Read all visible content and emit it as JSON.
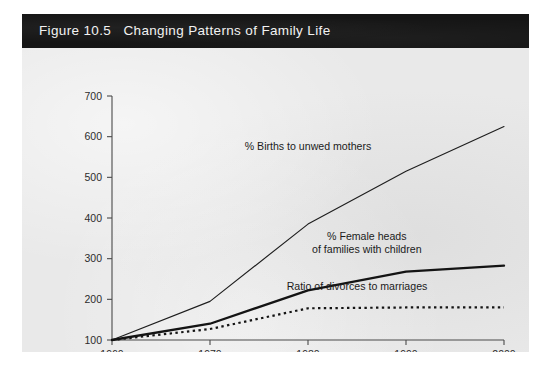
{
  "figure": {
    "title": "Figure 10.5   Changing Patterns of Family Life",
    "background_color": "#e9e9e9",
    "header_color": "#151515",
    "header_text_color": "#f2f2f2"
  },
  "chart_data": {
    "type": "line",
    "title": "Figure 10.5   Changing Patterns of Family Life",
    "xlabel": "",
    "ylabel": "",
    "x": [
      1960,
      1970,
      1980,
      1990,
      2000
    ],
    "xlim": [
      1960,
      2000
    ],
    "ylim": [
      100,
      700
    ],
    "xticks": [
      1960,
      1970,
      1980,
      1990,
      2000
    ],
    "yticks": [
      100,
      200,
      300,
      400,
      500,
      600,
      700
    ],
    "xtick_labels": [
      "1960",
      "1970",
      "1980",
      "1990",
      "2000"
    ],
    "ytick_labels": [
      "100",
      "200",
      "300",
      "400",
      "500",
      "600",
      "700"
    ],
    "grid": false,
    "legend": "inline-annotations",
    "series": [
      {
        "name": "% Births to unwed mothers",
        "values": [
          100,
          195,
          385,
          515,
          625
        ],
        "style": "solid-thin",
        "color": "#1e1e1e",
        "label_x": 1980,
        "label_y": 567
      },
      {
        "name": "% Female heads of families with children",
        "values": [
          100,
          140,
          222,
          268,
          283
        ],
        "style": "solid-thick",
        "color": "#141414",
        "label_line1": "% Female heads",
        "label_line2": "of families with children",
        "label_x": 1986,
        "label_y": 345
      },
      {
        "name": "Ratio of divorces to marriages",
        "values": [
          100,
          127,
          178,
          180,
          180
        ],
        "style": "dotted",
        "color": "#141414",
        "label_x": 1985,
        "label_y": 223
      }
    ]
  }
}
